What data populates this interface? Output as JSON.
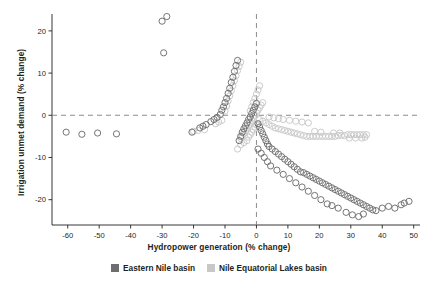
{
  "chart_data": {
    "type": "scatter",
    "title": "",
    "xlabel": "Hydropower generation (% change)",
    "ylabel": "Irrigation unmet demand (% change)",
    "xlim": [
      -65,
      52
    ],
    "ylim": [
      24,
      -26
    ],
    "xticks": [
      -60,
      -50,
      -40,
      -30,
      -20,
      -10,
      0,
      10,
      20,
      30,
      40,
      50
    ],
    "yticks": [
      20,
      10,
      0,
      -10,
      -20
    ],
    "xtick_labels": [
      "-60",
      "-50",
      "-40",
      "-30",
      "-20",
      "-10",
      "0",
      "10",
      "20",
      "30",
      "40",
      "50"
    ],
    "ytick_labels": [
      "20",
      "10",
      "0",
      "-10",
      "-20"
    ],
    "grid": false,
    "reference_lines": {
      "x": 0,
      "y": 0,
      "style": "dashed",
      "color": "#808080"
    },
    "legend": {
      "position": "bottom-center",
      "entries": [
        {
          "name": "Eastern Nile basin",
          "color": "#6e6e6e"
        },
        {
          "name": "Nile Equatorial Lakes basin",
          "color": "#c8c8c8"
        }
      ]
    },
    "series": [
      {
        "name": "Eastern Nile basin",
        "color": "#6e6e6e",
        "marker": "open-circle",
        "points": [
          [
            -60.5,
            -4.0
          ],
          [
            -55.5,
            -4.5
          ],
          [
            -50.5,
            -4.2
          ],
          [
            -44.5,
            -4.4
          ],
          [
            -30.0,
            22.3
          ],
          [
            -28.5,
            23.4
          ],
          [
            -29.5,
            14.8
          ],
          [
            -20.5,
            -4.0
          ],
          [
            -18.0,
            -3.0
          ],
          [
            -17.0,
            -2.6
          ],
          [
            -16.0,
            -2.2
          ],
          [
            -14.5,
            -1.5
          ],
          [
            -13.5,
            -1.0
          ],
          [
            -12.5,
            -0.5
          ],
          [
            -11.5,
            0.2
          ],
          [
            -11.0,
            1.2
          ],
          [
            -10.5,
            2.0
          ],
          [
            -10.0,
            3.0
          ],
          [
            -9.5,
            4.0
          ],
          [
            -9.0,
            5.2
          ],
          [
            -8.5,
            6.4
          ],
          [
            -8.0,
            7.8
          ],
          [
            -7.5,
            9.0
          ],
          [
            -7.0,
            10.4
          ],
          [
            -6.5,
            11.8
          ],
          [
            -6.0,
            13.0
          ],
          [
            -5.5,
            -6.0
          ],
          [
            -5.0,
            -5.0
          ],
          [
            -4.5,
            -4.0
          ],
          [
            -4.0,
            -3.2
          ],
          [
            -3.5,
            -2.5
          ],
          [
            -3.0,
            -1.8
          ],
          [
            -2.5,
            -1.0
          ],
          [
            -2.0,
            -0.4
          ],
          [
            -1.5,
            0.4
          ],
          [
            -1.0,
            1.2
          ],
          [
            -0.5,
            2.0
          ],
          [
            0.0,
            2.8
          ],
          [
            0.5,
            -2.0
          ],
          [
            1.0,
            -2.8
          ],
          [
            1.5,
            -3.6
          ],
          [
            2.0,
            -4.4
          ],
          [
            2.5,
            -5.2
          ],
          [
            3.0,
            -6.0
          ],
          [
            3.5,
            -6.8
          ],
          [
            4.0,
            -7.4
          ],
          [
            5.0,
            -8.0
          ],
          [
            6.0,
            -8.6
          ],
          [
            7.0,
            -9.2
          ],
          [
            8.0,
            -9.8
          ],
          [
            9.0,
            -10.4
          ],
          [
            10.0,
            -11.0
          ],
          [
            11.0,
            -11.6
          ],
          [
            12.0,
            -12.2
          ],
          [
            13.0,
            -12.8
          ],
          [
            14.0,
            -13.4
          ],
          [
            15.0,
            -13.6
          ],
          [
            16.0,
            -14.0
          ],
          [
            17.0,
            -14.4
          ],
          [
            18.0,
            -14.8
          ],
          [
            19.0,
            -15.2
          ],
          [
            20.0,
            -15.6
          ],
          [
            21.0,
            -16.0
          ],
          [
            22.0,
            -16.4
          ],
          [
            23.0,
            -16.8
          ],
          [
            24.0,
            -17.2
          ],
          [
            25.0,
            -17.6
          ],
          [
            26.0,
            -18.0
          ],
          [
            27.0,
            -18.4
          ],
          [
            28.0,
            -18.8
          ],
          [
            29.0,
            -19.2
          ],
          [
            30.0,
            -19.6
          ],
          [
            31.0,
            -20.0
          ],
          [
            32.0,
            -20.4
          ],
          [
            33.0,
            -20.8
          ],
          [
            34.0,
            -21.2
          ],
          [
            35.0,
            -21.6
          ],
          [
            36.0,
            -22.0
          ],
          [
            37.0,
            -22.4
          ],
          [
            38.0,
            -22.6
          ],
          [
            40.0,
            -22.0
          ],
          [
            42.0,
            -21.6
          ],
          [
            44.0,
            -22.0
          ],
          [
            46.0,
            -21.2
          ],
          [
            47.0,
            -20.8
          ],
          [
            48.5,
            -20.4
          ],
          [
            28.5,
            -23.0
          ],
          [
            30.5,
            -23.6
          ],
          [
            32.5,
            -24.0
          ],
          [
            34.0,
            -23.4
          ],
          [
            22.5,
            -21.0
          ],
          [
            24.0,
            -21.4
          ],
          [
            26.0,
            -22.0
          ],
          [
            20.5,
            -20.0
          ],
          [
            18.5,
            -19.0
          ],
          [
            16.5,
            -18.0
          ],
          [
            14.5,
            -17.0
          ],
          [
            12.5,
            -16.0
          ],
          [
            10.5,
            -15.0
          ],
          [
            8.5,
            -14.0
          ],
          [
            6.5,
            -13.0
          ],
          [
            4.5,
            -12.0
          ],
          [
            3.5,
            -11.0
          ],
          [
            2.5,
            -10.0
          ],
          [
            1.5,
            -9.0
          ],
          [
            0.5,
            -8.0
          ]
        ]
      },
      {
        "name": "Nile Equatorial Lakes basin",
        "color": "#c8c8c8",
        "marker": "open-circle",
        "points": [
          [
            -20.0,
            -3.8
          ],
          [
            -18.5,
            -3.6
          ],
          [
            -16.5,
            -3.4
          ],
          [
            -13.0,
            -2.0
          ],
          [
            -12.0,
            -1.6
          ],
          [
            -11.0,
            -1.2
          ],
          [
            -10.0,
            1.0
          ],
          [
            -9.5,
            2.2
          ],
          [
            -9.0,
            3.4
          ],
          [
            -8.5,
            4.6
          ],
          [
            -8.0,
            5.8
          ],
          [
            -7.5,
            7.0
          ],
          [
            -7.0,
            8.2
          ],
          [
            -6.5,
            9.4
          ],
          [
            -6.0,
            10.6
          ],
          [
            -5.5,
            11.6
          ],
          [
            -5.0,
            12.6
          ],
          [
            -5.0,
            -5.5
          ],
          [
            -4.5,
            -4.8
          ],
          [
            -4.0,
            -4.2
          ],
          [
            -3.5,
            -3.6
          ],
          [
            -3.0,
            -3.0
          ],
          [
            -2.5,
            -2.4
          ],
          [
            -2.0,
            -1.8
          ],
          [
            -1.5,
            -1.2
          ],
          [
            -1.0,
            -0.6
          ],
          [
            -0.5,
            0.0
          ],
          [
            0.0,
            0.6
          ],
          [
            0.5,
            1.2
          ],
          [
            1.0,
            1.8
          ],
          [
            1.5,
            2.4
          ],
          [
            2.0,
            3.0
          ],
          [
            1.0,
            -1.0
          ],
          [
            2.0,
            -1.4
          ],
          [
            3.0,
            -1.8
          ],
          [
            4.0,
            -2.2
          ],
          [
            5.0,
            -2.6
          ],
          [
            6.0,
            -3.0
          ],
          [
            7.0,
            -3.2
          ],
          [
            8.0,
            -3.4
          ],
          [
            9.0,
            -3.6
          ],
          [
            10.0,
            -3.8
          ],
          [
            11.0,
            -4.0
          ],
          [
            12.0,
            -4.2
          ],
          [
            13.0,
            -4.4
          ],
          [
            14.0,
            -4.6
          ],
          [
            15.0,
            -4.8
          ],
          [
            16.0,
            -5.0
          ],
          [
            17.0,
            -5.0
          ],
          [
            18.0,
            -5.0
          ],
          [
            19.0,
            -5.0
          ],
          [
            20.0,
            -5.0
          ],
          [
            21.0,
            -5.0
          ],
          [
            22.0,
            -5.0
          ],
          [
            23.0,
            -5.0
          ],
          [
            24.0,
            -5.0
          ],
          [
            25.0,
            -5.0
          ],
          [
            26.0,
            -4.8
          ],
          [
            27.0,
            -4.8
          ],
          [
            28.0,
            -4.8
          ],
          [
            29.0,
            -4.6
          ],
          [
            30.0,
            -4.6
          ],
          [
            31.0,
            -4.6
          ],
          [
            32.0,
            -4.6
          ],
          [
            33.0,
            -4.6
          ],
          [
            34.0,
            -4.6
          ],
          [
            35.0,
            -4.6
          ],
          [
            29.5,
            -5.4
          ],
          [
            31.5,
            -5.4
          ],
          [
            33.5,
            -5.4
          ],
          [
            34.5,
            -5.2
          ],
          [
            24.5,
            -4.2
          ],
          [
            26.5,
            -4.2
          ],
          [
            20.5,
            -4.0
          ],
          [
            18.5,
            -3.8
          ],
          [
            4.0,
            -0.4
          ],
          [
            5.5,
            -0.6
          ],
          [
            7.0,
            -0.8
          ],
          [
            8.5,
            -1.0
          ],
          [
            10.5,
            -1.2
          ],
          [
            12.5,
            -1.4
          ],
          [
            14.5,
            -1.6
          ],
          [
            16.5,
            -1.8
          ],
          [
            -2.0,
            1.0
          ],
          [
            -1.5,
            2.0
          ],
          [
            -1.0,
            3.0
          ],
          [
            -0.5,
            4.0
          ],
          [
            0.0,
            5.0
          ],
          [
            0.5,
            6.0
          ],
          [
            1.0,
            7.0
          ],
          [
            -6.0,
            -8.0
          ],
          [
            -5.0,
            -7.0
          ],
          [
            -4.0,
            -6.5
          ],
          [
            -3.0,
            -6.0
          ],
          [
            -2.5,
            -5.2
          ],
          [
            -2.0,
            -4.6
          ],
          [
            -1.5,
            -4.0
          ],
          [
            -1.0,
            -3.4
          ],
          [
            -0.5,
            -2.8
          ],
          [
            0.0,
            -2.2
          ]
        ]
      }
    ]
  }
}
